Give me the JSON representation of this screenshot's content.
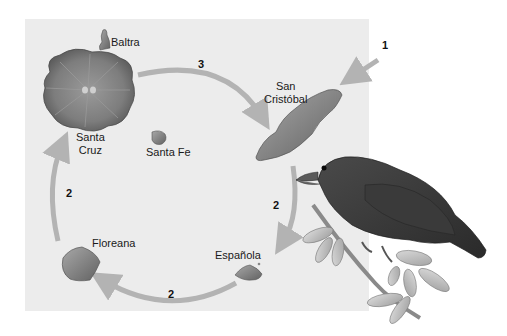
{
  "figure": {
    "type": "island-colonization-diagram",
    "background_panel_color": "#ececec",
    "arrow_color": "#b3b3b3"
  },
  "islands": [
    {
      "id": "baltra",
      "label": "Baltra"
    },
    {
      "id": "santa-cruz",
      "label_line1": "Santa",
      "label_line2": "Cruz"
    },
    {
      "id": "santa-fe",
      "label": "Santa Fe"
    },
    {
      "id": "san-cristobal",
      "label_line1": "San",
      "label_line2": "Cristóbal"
    },
    {
      "id": "floreana",
      "label": "Floreana"
    },
    {
      "id": "espanola",
      "label": "Española"
    }
  ],
  "arrows": [
    {
      "step": "1",
      "from": "mainland",
      "to": "San Cristóbal"
    },
    {
      "step": "2",
      "from": "San Cristóbal",
      "to": "Española"
    },
    {
      "step": "2",
      "from": "Española",
      "to": "Floreana"
    },
    {
      "step": "2",
      "from": "Floreana",
      "to": "Santa Cruz"
    },
    {
      "step": "3",
      "from": "Santa Cruz",
      "to": "San Cristóbal"
    }
  ],
  "illustration": {
    "subject": "finch perched on leafy branch"
  }
}
